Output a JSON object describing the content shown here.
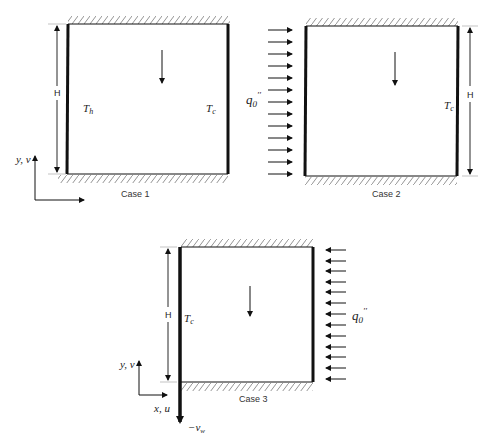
{
  "figure": {
    "case1": {
      "caption": "Case 1",
      "height_label": "H",
      "left_wall_label": "T_h",
      "left_wall_sub": "h",
      "right_wall_label": "T_c",
      "right_wall_sub": "c",
      "axis_label": "y, v"
    },
    "case2": {
      "caption": "Case 2",
      "height_label": "H",
      "right_wall_label": "T_c",
      "right_wall_sub": "c",
      "flux_label": "q_0''",
      "flux_arrow_count": 13
    },
    "case3": {
      "caption": "Case 3",
      "height_label": "H",
      "left_wall_label": "T_c",
      "left_wall_sub": "c",
      "flux_label": "q_0''",
      "flux_arrow_count": 13,
      "y_axis_label": "y, v",
      "x_axis_label": "x, u",
      "wall_velocity_label": "−v_w",
      "wall_velocity_sub": "w"
    },
    "colors": {
      "line": "#111111",
      "hatch": "#777777",
      "text": "#333333"
    }
  }
}
